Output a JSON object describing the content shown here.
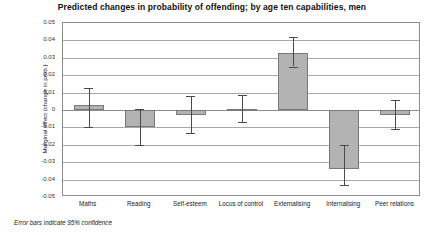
{
  "chart_data": {
    "type": "bar",
    "title": "Predicted changes in probability of offending; by age ten capabilities, men",
    "xlabel": "",
    "ylabel": "Marginal effect (change in prob.)",
    "ylim": [
      -0.05,
      0.05
    ],
    "ytick_labels": [
      "0.05",
      "0.04",
      "0.03",
      "0.02",
      "0.01",
      "0",
      "-0.01",
      "-0.02",
      "-0.03",
      "-0.04",
      "-0.05"
    ],
    "ytick_values": [
      0.05,
      0.04,
      0.03,
      0.02,
      0.01,
      0,
      -0.01,
      -0.02,
      -0.03,
      -0.04,
      -0.05
    ],
    "grid": true,
    "legend": "none",
    "categories": [
      "Maths",
      "Reading",
      "Self-esteem",
      "Locus of control",
      "Externalising",
      "Internalising",
      "Peer relations"
    ],
    "values": [
      0.003,
      -0.01,
      -0.003,
      0.0005,
      0.033,
      -0.034,
      -0.003
    ],
    "error_low": [
      -0.01,
      -0.02,
      -0.013,
      -0.007,
      0.025,
      -0.043,
      -0.011
    ],
    "error_high": [
      0.0125,
      0.0005,
      0.008,
      0.0085,
      0.042,
      -0.02,
      0.006
    ],
    "annotation": "Error bars indicate 95% confidence",
    "bar_fill": "#b3b3b3",
    "bar_stroke": "#7a7a7a",
    "error_color": "#4a4a4a",
    "grid_color": "#a8a8a8"
  }
}
